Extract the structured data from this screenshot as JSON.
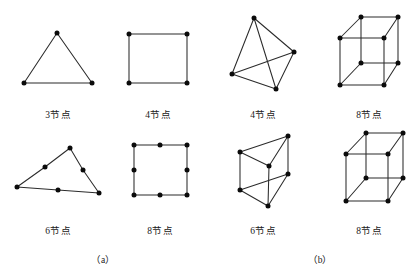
{
  "figure": {
    "width": 420,
    "height": 268,
    "background": "#ffffff",
    "edge_color": "#2b2b2b",
    "node_color": "#0b0b0b",
    "panels": [
      {
        "id": "panel-a",
        "label": "（a）",
        "x": 103,
        "y": 252
      },
      {
        "id": "panel-b",
        "label": "（b）",
        "x": 320,
        "y": 252
      }
    ],
    "elements": [
      {
        "id": "triangle-3-node",
        "label": "3节点",
        "label_x": 58,
        "label_y": 107,
        "nodes": [
          [
            57,
            33
          ],
          [
            24,
            83
          ],
          [
            92,
            83
          ]
        ],
        "edges": [
          [
            0,
            1
          ],
          [
            1,
            2
          ],
          [
            2,
            0
          ]
        ]
      },
      {
        "id": "quad-4-node",
        "label": "4节点",
        "label_x": 158,
        "label_y": 107,
        "nodes": [
          [
            129,
            34
          ],
          [
            187,
            34
          ],
          [
            187,
            83
          ],
          [
            129,
            83
          ]
        ],
        "edges": [
          [
            0,
            1
          ],
          [
            1,
            2
          ],
          [
            2,
            3
          ],
          [
            3,
            0
          ]
        ]
      },
      {
        "id": "tetrahedron-4-node",
        "label": "4节点",
        "label_x": 263,
        "label_y": 107,
        "nodes": [
          [
            254,
            18
          ],
          [
            294,
            52
          ],
          [
            232,
            74
          ],
          [
            276,
            89
          ]
        ],
        "edges": [
          [
            0,
            1
          ],
          [
            0,
            2
          ],
          [
            0,
            3
          ],
          [
            1,
            2
          ],
          [
            1,
            3
          ],
          [
            2,
            3
          ]
        ]
      },
      {
        "id": "hexahedron-8-node",
        "label": "8节点",
        "label_x": 369,
        "label_y": 107,
        "nodes": [
          [
            361,
            17
          ],
          [
            398,
            17
          ],
          [
            340,
            38
          ],
          [
            384,
            38
          ],
          [
            361,
            63
          ],
          [
            398,
            63
          ],
          [
            340,
            85
          ],
          [
            384,
            85
          ]
        ],
        "edges": [
          [
            0,
            1
          ],
          [
            0,
            2
          ],
          [
            1,
            3
          ],
          [
            2,
            3
          ],
          [
            0,
            4
          ],
          [
            1,
            5
          ],
          [
            2,
            6
          ],
          [
            3,
            7
          ],
          [
            4,
            5
          ],
          [
            4,
            6
          ],
          [
            5,
            7
          ],
          [
            6,
            7
          ]
        ]
      },
      {
        "id": "triangle-6-node",
        "label": "6节点",
        "label_x": 58,
        "label_y": 223,
        "nodes": [
          [
            70,
            148
          ],
          [
            45,
            167
          ],
          [
            17,
            187
          ],
          [
            58,
            190
          ],
          [
            99,
            193
          ],
          [
            83,
            170
          ]
        ],
        "edges": [
          [
            0,
            1
          ],
          [
            1,
            2
          ],
          [
            2,
            3
          ],
          [
            3,
            4
          ],
          [
            4,
            5
          ],
          [
            5,
            0
          ]
        ]
      },
      {
        "id": "quad-8-node",
        "label": "8节点",
        "label_x": 160,
        "label_y": 223,
        "nodes": [
          [
            134,
            145
          ],
          [
            160,
            145
          ],
          [
            187,
            145
          ],
          [
            187,
            170
          ],
          [
            187,
            195
          ],
          [
            160,
            195
          ],
          [
            134,
            195
          ],
          [
            134,
            170
          ]
        ],
        "edges": [
          [
            0,
            1
          ],
          [
            1,
            2
          ],
          [
            2,
            3
          ],
          [
            3,
            4
          ],
          [
            4,
            5
          ],
          [
            5,
            6
          ],
          [
            6,
            7
          ],
          [
            7,
            0
          ]
        ]
      },
      {
        "id": "prism-6-node",
        "label": "6节点",
        "label_x": 263,
        "label_y": 223,
        "nodes": [
          [
            240,
            152
          ],
          [
            288,
            136
          ],
          [
            269,
            166
          ],
          [
            240,
            190
          ],
          [
            288,
            174
          ],
          [
            268,
            206
          ]
        ],
        "edges": [
          [
            0,
            1
          ],
          [
            1,
            2
          ],
          [
            2,
            0
          ],
          [
            3,
            4
          ],
          [
            4,
            5
          ],
          [
            5,
            3
          ],
          [
            0,
            3
          ],
          [
            1,
            4
          ],
          [
            2,
            5
          ]
        ]
      },
      {
        "id": "hexahedron-8-node-b",
        "label": "8节点",
        "label_x": 369,
        "label_y": 223,
        "nodes": [
          [
            366,
            133
          ],
          [
            403,
            133
          ],
          [
            346,
            154
          ],
          [
            388,
            154
          ],
          [
            366,
            178
          ],
          [
            403,
            178
          ],
          [
            346,
            201
          ],
          [
            388,
            201
          ]
        ],
        "edges": [
          [
            0,
            1
          ],
          [
            0,
            2
          ],
          [
            1,
            3
          ],
          [
            2,
            3
          ],
          [
            0,
            4
          ],
          [
            1,
            5
          ],
          [
            2,
            6
          ],
          [
            3,
            7
          ],
          [
            4,
            5
          ],
          [
            4,
            6
          ],
          [
            5,
            7
          ],
          [
            6,
            7
          ]
        ]
      }
    ]
  }
}
